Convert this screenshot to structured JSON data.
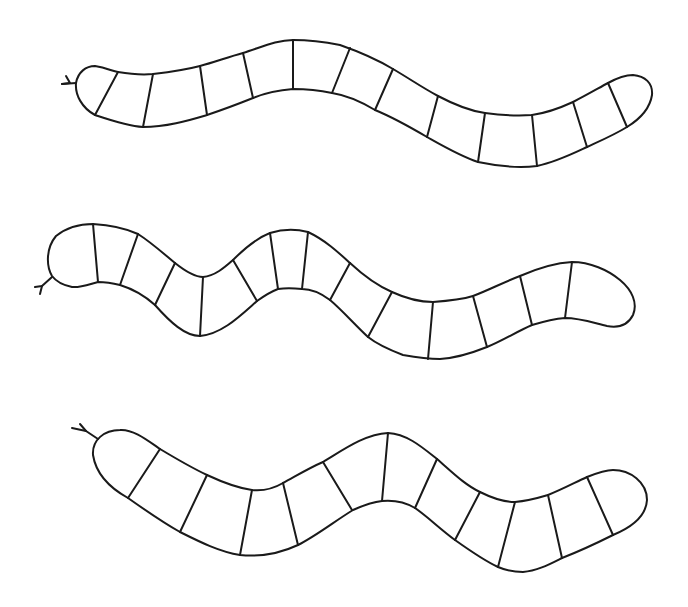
{
  "image": {
    "description": "Three outlined segmented worm/snake coloring shapes on white background",
    "background": "#ffffff",
    "stroke_color": "#1a1a1a"
  },
  "snakes": [
    {
      "label": "snake-1",
      "segment_count": 14,
      "head_side": "left",
      "has_forked_tongue": true
    },
    {
      "label": "snake-2",
      "segment_count": 14,
      "head_side": "left",
      "has_forked_tongue": true
    },
    {
      "label": "snake-3",
      "segment_count": 12,
      "head_side": "left",
      "has_forked_tongue": true
    }
  ]
}
